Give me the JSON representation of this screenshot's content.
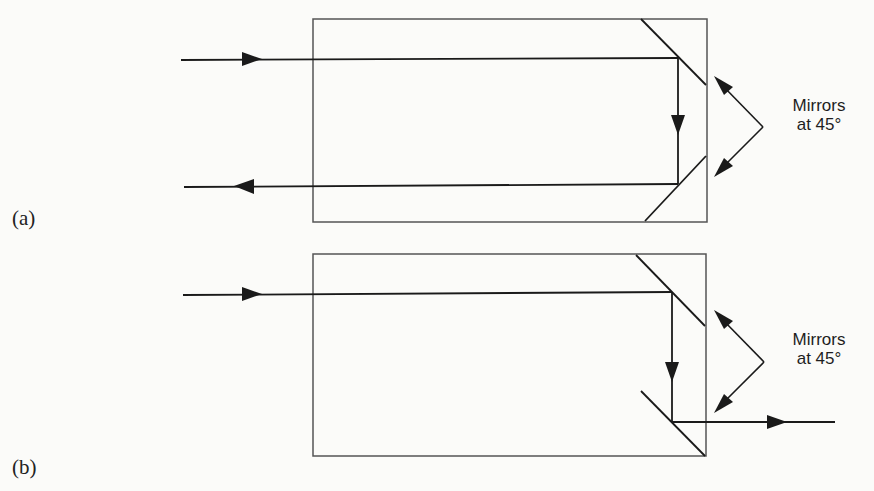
{
  "figure": {
    "panels": [
      {
        "id": "a",
        "label": "(a)",
        "annotation": {
          "line1": "Mirrors",
          "line2": "at 45°"
        },
        "beams": [
          "input beam (left→right, top)",
          "beam reflected downward",
          "output beam (right→left, bottom)"
        ]
      },
      {
        "id": "b",
        "label": "(b)",
        "annotation": {
          "line1": "Mirrors",
          "line2": "at 45°"
        },
        "beams": [
          "input beam (left→right, top)",
          "beam reflected downward",
          "output beam (left→right, exits right)"
        ]
      }
    ],
    "colors": {
      "line": "#1a1a1a",
      "box": "#555555",
      "background": "#fbfbf9"
    }
  }
}
